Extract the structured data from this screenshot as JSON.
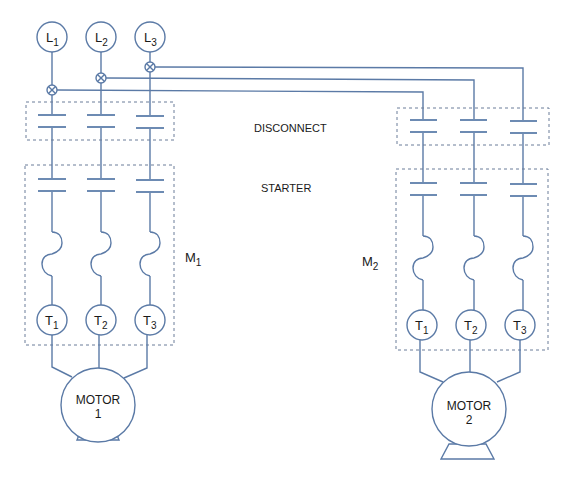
{
  "diagram": {
    "colors": {
      "wire": "#5b7aa6",
      "box": "#6b7d99",
      "text": "#1a1a1a"
    },
    "lines": [
      {
        "label": "L",
        "sub": "1"
      },
      {
        "label": "L",
        "sub": "2"
      },
      {
        "label": "L",
        "sub": "3"
      }
    ],
    "labels": {
      "disconnect": "DISCONNECT",
      "starter": "STARTER",
      "m1": "M",
      "m1_sub": "1",
      "m2": "M",
      "m2_sub": "2"
    },
    "terminals": [
      {
        "label": "T",
        "sub": "1"
      },
      {
        "label": "T",
        "sub": "2"
      },
      {
        "label": "T",
        "sub": "3"
      }
    ],
    "motor1": {
      "line1": "MOTOR",
      "line2": "1"
    },
    "motor2": {
      "line1": "MOTOR",
      "line2": "2"
    }
  }
}
